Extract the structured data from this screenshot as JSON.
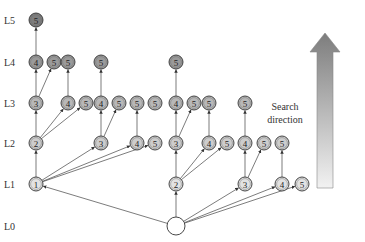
{
  "levels": [
    {
      "label": "L5",
      "y": 20
    },
    {
      "label": "L4",
      "y": 62
    },
    {
      "label": "L3",
      "y": 103
    },
    {
      "label": "L2",
      "y": 143
    },
    {
      "label": "L1",
      "y": 184
    },
    {
      "label": "L0",
      "y": 226
    }
  ],
  "level_colors": {
    "0": "#ffffff",
    "1": "#e2e2e2",
    "2": "#cdcdcd",
    "3": "#b8b8b8",
    "4": "#9a9a9a",
    "5": "#7e7e7e"
  },
  "nodes": [
    {
      "id": "root",
      "label": "",
      "x": 176,
      "level": 0
    },
    {
      "id": "a1",
      "label": "1",
      "x": 36,
      "level": 1
    },
    {
      "id": "a2",
      "label": "2",
      "x": 176,
      "level": 1
    },
    {
      "id": "a3",
      "label": "3",
      "x": 245,
      "level": 1
    },
    {
      "id": "a4",
      "label": "4",
      "x": 282,
      "level": 1
    },
    {
      "id": "a5",
      "label": "5",
      "x": 302,
      "level": 1
    },
    {
      "id": "b12",
      "label": "2",
      "x": 36,
      "level": 2
    },
    {
      "id": "b13",
      "label": "3",
      "x": 101,
      "level": 2
    },
    {
      "id": "b14",
      "label": "4",
      "x": 137,
      "level": 2
    },
    {
      "id": "b15",
      "label": "5",
      "x": 155,
      "level": 2
    },
    {
      "id": "b23",
      "label": "3",
      "x": 176,
      "level": 2
    },
    {
      "id": "b24",
      "label": "4",
      "x": 209,
      "level": 2
    },
    {
      "id": "b25",
      "label": "5",
      "x": 227,
      "level": 2
    },
    {
      "id": "b34",
      "label": "4",
      "x": 245,
      "level": 2
    },
    {
      "id": "b35",
      "label": "5",
      "x": 264,
      "level": 2
    },
    {
      "id": "b45",
      "label": "5",
      "x": 282,
      "level": 2
    },
    {
      "id": "c123",
      "label": "3",
      "x": 36,
      "level": 3
    },
    {
      "id": "c124",
      "label": "4",
      "x": 68,
      "level": 3
    },
    {
      "id": "c125",
      "label": "5",
      "x": 86,
      "level": 3
    },
    {
      "id": "c134",
      "label": "4",
      "x": 101,
      "level": 3
    },
    {
      "id": "c135",
      "label": "5",
      "x": 119,
      "level": 3
    },
    {
      "id": "c145",
      "label": "5",
      "x": 137,
      "level": 3
    },
    {
      "id": "c155",
      "label": "5",
      "x": 155,
      "level": 3
    },
    {
      "id": "c234",
      "label": "4",
      "x": 176,
      "level": 3
    },
    {
      "id": "c235",
      "label": "5",
      "x": 194,
      "level": 3
    },
    {
      "id": "c245",
      "label": "5",
      "x": 209,
      "level": 3
    },
    {
      "id": "c345",
      "label": "5",
      "x": 245,
      "level": 3
    },
    {
      "id": "d1234",
      "label": "4",
      "x": 36,
      "level": 4
    },
    {
      "id": "d1235",
      "label": "5",
      "x": 54,
      "level": 4
    },
    {
      "id": "d1245",
      "label": "5",
      "x": 68,
      "level": 4
    },
    {
      "id": "d1345",
      "label": "5",
      "x": 101,
      "level": 4
    },
    {
      "id": "d2345",
      "label": "5",
      "x": 176,
      "level": 4
    },
    {
      "id": "e12345",
      "label": "5",
      "x": 36,
      "level": 5
    }
  ],
  "edges": [
    [
      "root",
      "a1"
    ],
    [
      "root",
      "a2"
    ],
    [
      "root",
      "a3"
    ],
    [
      "root",
      "a4"
    ],
    [
      "root",
      "a5"
    ],
    [
      "a1",
      "b12"
    ],
    [
      "a1",
      "b13"
    ],
    [
      "a1",
      "b14"
    ],
    [
      "a1",
      "b15"
    ],
    [
      "a2",
      "b23"
    ],
    [
      "a2",
      "b24"
    ],
    [
      "a2",
      "b25"
    ],
    [
      "a3",
      "b34"
    ],
    [
      "a3",
      "b35"
    ],
    [
      "a4",
      "b45"
    ],
    [
      "b12",
      "c123"
    ],
    [
      "b12",
      "c124"
    ],
    [
      "b12",
      "c125"
    ],
    [
      "b13",
      "c134"
    ],
    [
      "b13",
      "c135"
    ],
    [
      "b14",
      "c145"
    ],
    [
      "b23",
      "c234"
    ],
    [
      "b23",
      "c235"
    ],
    [
      "b24",
      "c245"
    ],
    [
      "b34",
      "c345"
    ],
    [
      "c123",
      "d1234"
    ],
    [
      "c123",
      "d1235"
    ],
    [
      "c124",
      "d1245"
    ],
    [
      "c134",
      "d1345"
    ],
    [
      "c234",
      "d2345"
    ],
    [
      "d1234",
      "e12345"
    ]
  ],
  "search_direction": {
    "line1": "Search",
    "line2": "direction"
  }
}
